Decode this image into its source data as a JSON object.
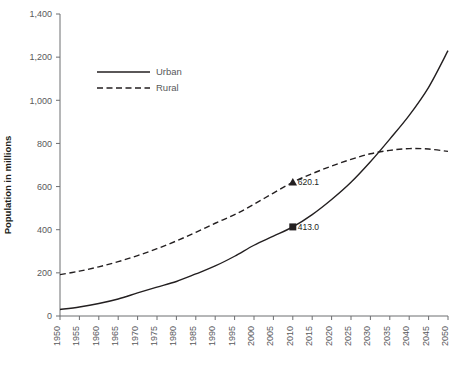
{
  "chart_data": {
    "type": "line",
    "title": "",
    "xlabel": "",
    "ylabel": "Population in millions",
    "xlim": [
      1950,
      2050
    ],
    "ylim": [
      0,
      1400
    ],
    "ytick_step": 200,
    "xtick_step": 5,
    "grid": false,
    "legend_position": "upper-left-inside",
    "x": [
      1950,
      1955,
      1960,
      1965,
      1970,
      1975,
      1980,
      1985,
      1990,
      1995,
      2000,
      2005,
      2010,
      2015,
      2020,
      2025,
      2030,
      2035,
      2040,
      2045,
      2050
    ],
    "xtick_labels": [
      "1950",
      "1955",
      "1960",
      "1965",
      "1970",
      "1975",
      "1980",
      "1985",
      "1990",
      "1995",
      "2000",
      "2005",
      "2010",
      "2015",
      "2020",
      "2025",
      "2030",
      "2035",
      "2040",
      "2045",
      "2050"
    ],
    "ytick_labels": [
      "0",
      "200",
      "400",
      "600",
      "800",
      "1,000",
      "1,200",
      "1,400"
    ],
    "ytick_values": [
      0,
      200,
      400,
      600,
      800,
      1000,
      1200,
      1400
    ],
    "series": [
      {
        "name": "Urban",
        "style": "solid",
        "color": "#231f20",
        "values": [
          30,
          42,
          58,
          79,
          107,
          134,
          160,
          195,
          232,
          277,
          328,
          370,
          413,
          470,
          540,
          620,
          715,
          820,
          930,
          1060,
          1230
        ]
      },
      {
        "name": "Rural",
        "style": "dashed",
        "color": "#231f20",
        "values": [
          192,
          208,
          228,
          252,
          280,
          312,
          348,
          388,
          430,
          470,
          518,
          570,
          620,
          660,
          695,
          726,
          752,
          768,
          776,
          774,
          763
        ]
      }
    ],
    "annotations": [
      {
        "series": "Rural",
        "x": 2010,
        "y": 620.1,
        "label": "620.1",
        "marker": "triangle"
      },
      {
        "series": "Urban",
        "x": 2010,
        "y": 413.0,
        "label": "413.0",
        "marker": "square"
      }
    ],
    "legend": [
      {
        "label": "Urban",
        "style": "solid"
      },
      {
        "label": "Rural",
        "style": "dashed"
      }
    ]
  },
  "colors": {
    "axis": "#6d6e71",
    "tick_text": "#58595b",
    "line": "#231f20",
    "background": "#ffffff"
  }
}
